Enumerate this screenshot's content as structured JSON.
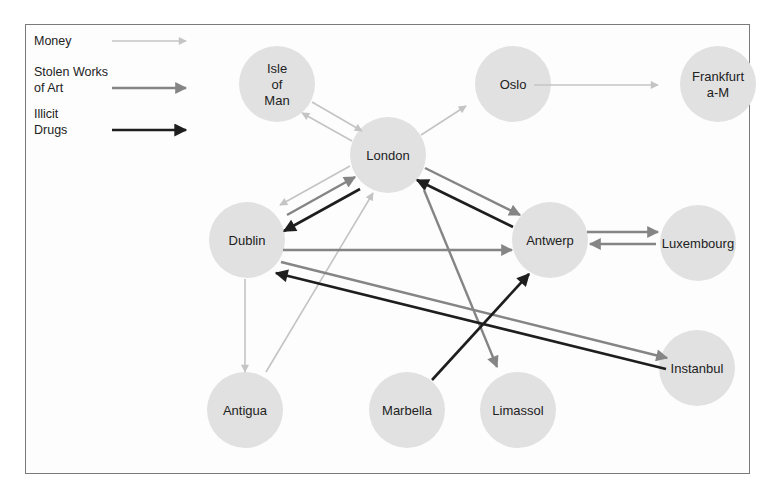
{
  "diagram": {
    "type": "network-flow",
    "colors": {
      "money": "#c4c4c4",
      "art": "#858585",
      "drugs": "#1e1e1e",
      "node_fill": "#e1e1e1",
      "frame": "#7a7a7a"
    },
    "legend": [
      {
        "key": "money",
        "lines": [
          "Money"
        ]
      },
      {
        "key": "art",
        "lines": [
          "Stolen Works",
          "of Art"
        ]
      },
      {
        "key": "drugs",
        "lines": [
          "Illicit",
          "Drugs"
        ]
      }
    ],
    "nodes": [
      {
        "id": "isle_of_man",
        "lines": [
          "Isle",
          "of",
          "Man"
        ],
        "x": 277,
        "y": 84
      },
      {
        "id": "oslo",
        "lines": [
          "Oslo"
        ],
        "x": 513,
        "y": 84
      },
      {
        "id": "frankfurt",
        "lines": [
          "Frankfurt",
          "a-M"
        ],
        "x": 718,
        "y": 84
      },
      {
        "id": "london",
        "lines": [
          "London"
        ],
        "x": 388,
        "y": 155
      },
      {
        "id": "dublin",
        "lines": [
          "Dublin"
        ],
        "x": 247,
        "y": 240
      },
      {
        "id": "antwerp",
        "lines": [
          "Antwerp"
        ],
        "x": 550,
        "y": 240
      },
      {
        "id": "luxembourg",
        "lines": [
          "Luxembourg"
        ],
        "x": 698,
        "y": 243
      },
      {
        "id": "instanbul",
        "lines": [
          "Instanbul"
        ],
        "x": 697,
        "y": 368
      },
      {
        "id": "antigua",
        "lines": [
          "Antigua"
        ],
        "x": 245,
        "y": 410
      },
      {
        "id": "marbella",
        "lines": [
          "Marbella"
        ],
        "x": 407,
        "y": 410
      },
      {
        "id": "limassol",
        "lines": [
          "Limassol"
        ],
        "x": 518,
        "y": 410
      }
    ],
    "edges": [
      {
        "from": "isle_of_man",
        "to": "london",
        "type": "money",
        "x1": 312,
        "y1": 102,
        "x2": 362,
        "y2": 131
      },
      {
        "from": "london",
        "to": "isle_of_man",
        "type": "money",
        "x1": 352,
        "y1": 141,
        "x2": 302,
        "y2": 113
      },
      {
        "from": "london",
        "to": "oslo",
        "type": "money",
        "x1": 421,
        "y1": 135,
        "x2": 466,
        "y2": 106
      },
      {
        "from": "oslo",
        "to": "frankfurt",
        "type": "money",
        "x1": 534,
        "y1": 85,
        "x2": 658,
        "y2": 85
      },
      {
        "from": "london",
        "to": "dublin",
        "type": "money",
        "x1": 350,
        "y1": 166,
        "x2": 280,
        "y2": 205
      },
      {
        "from": "dublin",
        "to": "london",
        "type": "art",
        "x1": 287,
        "y1": 215,
        "x2": 355,
        "y2": 177
      },
      {
        "from": "london",
        "to": "dublin",
        "type": "drugs",
        "x1": 360,
        "y1": 189,
        "x2": 284,
        "y2": 231
      },
      {
        "from": "london",
        "to": "antwerp",
        "type": "art",
        "x1": 425,
        "y1": 168,
        "x2": 520,
        "y2": 215
      },
      {
        "from": "antwerp",
        "to": "london",
        "type": "drugs",
        "x1": 513,
        "y1": 227,
        "x2": 417,
        "y2": 180
      },
      {
        "from": "london",
        "to": "limassol",
        "type": "art",
        "x1": 424,
        "y1": 190,
        "x2": 497,
        "y2": 367
      },
      {
        "from": "antigua",
        "to": "london",
        "type": "money",
        "x1": 266,
        "y1": 372,
        "x2": 373,
        "y2": 193
      },
      {
        "from": "dublin",
        "to": "antwerp",
        "type": "art",
        "x1": 283,
        "y1": 250,
        "x2": 512,
        "y2": 250
      },
      {
        "from": "antwerp",
        "to": "luxembourg",
        "type": "art",
        "x1": 587,
        "y1": 232,
        "x2": 658,
        "y2": 232
      },
      {
        "from": "luxembourg",
        "to": "antwerp",
        "type": "art",
        "x1": 656,
        "y1": 244,
        "x2": 590,
        "y2": 244
      },
      {
        "from": "dublin",
        "to": "instanbul",
        "type": "art",
        "x1": 281,
        "y1": 262,
        "x2": 667,
        "y2": 358
      },
      {
        "from": "instanbul",
        "to": "dublin",
        "type": "drugs",
        "x1": 666,
        "y1": 369,
        "x2": 276,
        "y2": 273
      },
      {
        "from": "dublin",
        "to": "antigua",
        "type": "money",
        "x1": 245,
        "y1": 279,
        "x2": 245,
        "y2": 372
      },
      {
        "from": "marbella",
        "to": "antwerp",
        "type": "drugs",
        "x1": 432,
        "y1": 380,
        "x2": 529,
        "y2": 274
      }
    ],
    "node_radius": 38
  }
}
